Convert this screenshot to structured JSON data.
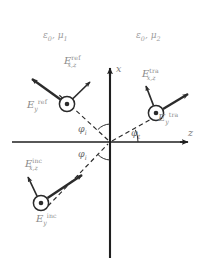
{
  "figure": {
    "background_color": "#ffffff",
    "line_color": "#2b2b2b",
    "label_color": "#8a8a8a",
    "width": 204,
    "height": 265
  },
  "media": {
    "left": {
      "label_eps": "ε",
      "label_eps_sub": "0",
      "label_mu": "μ",
      "label_mu_sub": "1",
      "separator": ", "
    },
    "right": {
      "label_eps": "ε",
      "label_eps_sub": "0",
      "label_mu": "μ",
      "label_mu_sub": "2",
      "separator": ", "
    }
  },
  "axes": {
    "vertical": {
      "label": "x",
      "name": "x-axis"
    },
    "horizontal": {
      "label": "z",
      "name": "z-axis"
    },
    "origin": {
      "x": 110,
      "y": 142
    }
  },
  "angles": [
    {
      "id": "phi-i-upper",
      "symbol": "φ",
      "subscript": "i",
      "value_deg": 45
    },
    {
      "id": "phi-i-lower",
      "symbol": "φ",
      "subscript": "i",
      "value_deg": 45
    },
    {
      "id": "phi-t",
      "symbol": "φ",
      "subscript": "t",
      "value_deg": 25
    }
  ],
  "fields": {
    "incident": {
      "inplane": {
        "base": "E",
        "sub": "x,z",
        "sup": "inc"
      },
      "outofplane": {
        "base": "E",
        "sub": "y",
        "sup": "inc"
      },
      "ray_name": "incident-ray",
      "marker": "circled-dot"
    },
    "reflected": {
      "inplane": {
        "base": "E",
        "sub": "x,z",
        "sup": "ref"
      },
      "outofplane": {
        "base": "E",
        "sub": "y",
        "sup": "ref"
      },
      "ray_name": "reflected-ray",
      "marker": "circled-dot"
    },
    "transmitted": {
      "inplane": {
        "base": "E",
        "sub": "x,z",
        "sup": "tra"
      },
      "outofplane": {
        "base": "E",
        "sub": "y",
        "sup": "tra"
      },
      "ray_name": "transmitted-ray",
      "marker": "circled-dot"
    }
  }
}
